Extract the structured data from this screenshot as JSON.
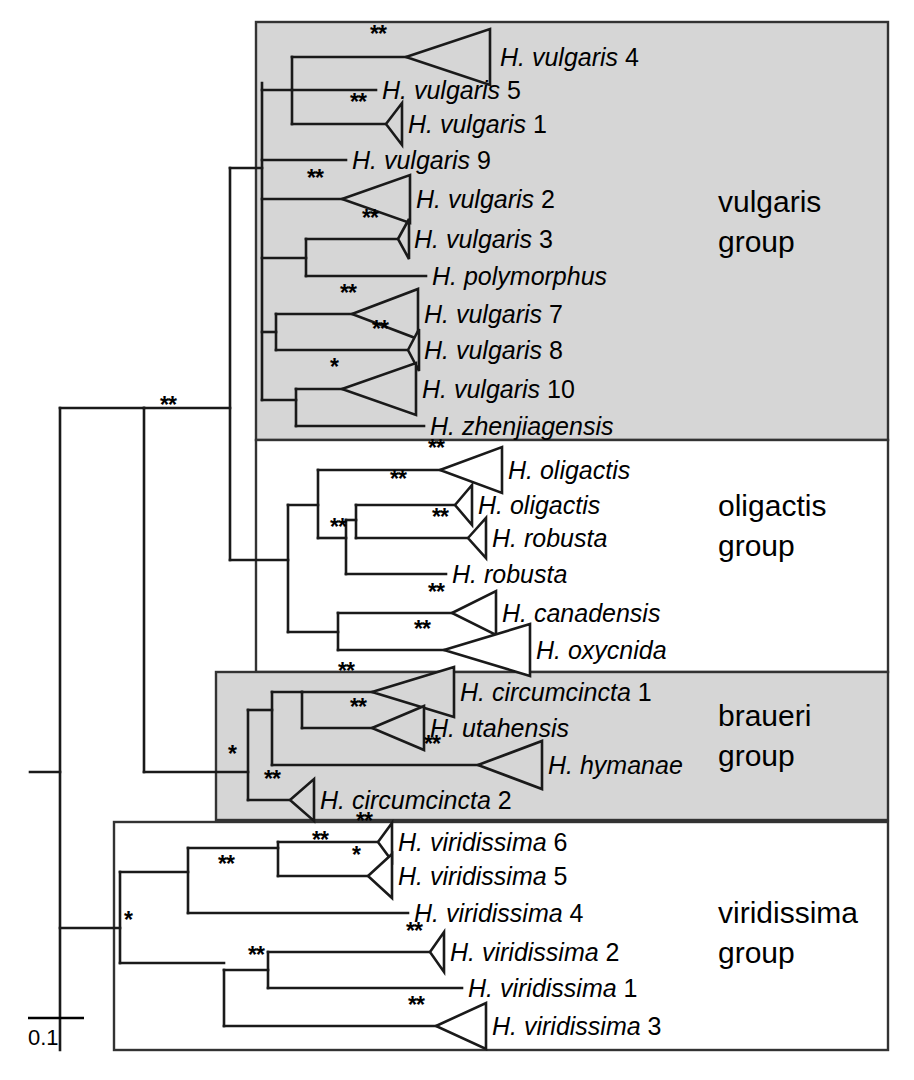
{
  "figure": {
    "scale_bar": {
      "label": "0.1",
      "length_px": 56
    },
    "support_symbols": {
      "strong": "**",
      "weak": "*"
    },
    "colors": {
      "shaded_band": "#d6d6d6",
      "line": "#1a1a1a",
      "background": "#ffffff"
    }
  },
  "groups": [
    {
      "id": "vulgaris",
      "label_line1": "vulgaris",
      "label_line2": "group",
      "shaded": true,
      "box": {
        "x": 256,
        "y": 22,
        "w": 632,
        "h": 418
      }
    },
    {
      "id": "oligactis",
      "label_line1": "oligactis",
      "label_line2": "group",
      "shaded": false,
      "box": {
        "x": 256,
        "y": 440,
        "w": 632,
        "h": 232
      }
    },
    {
      "id": "braueri",
      "label_line1": "braueri",
      "label_line2": "group",
      "shaded": true,
      "box": {
        "x": 216,
        "y": 672,
        "w": 672,
        "h": 148
      }
    },
    {
      "id": "viridissima",
      "label_line1": "viridissima",
      "label_line2": "group",
      "shaded": false,
      "box": {
        "x": 114,
        "y": 822,
        "w": 774,
        "h": 228
      }
    }
  ],
  "group_label_positions": [
    {
      "group": "vulgaris",
      "x": 718,
      "y1": 212,
      "y2": 252
    },
    {
      "group": "oligactis",
      "x": 718,
      "y1": 516,
      "y2": 556
    },
    {
      "group": "braueri",
      "x": 718,
      "y1": 726,
      "y2": 766
    },
    {
      "group": "viridissima",
      "x": 718,
      "y1": 923,
      "y2": 963
    }
  ],
  "taxa": [
    {
      "id": "vulgaris4",
      "genus": "H. ",
      "species": "vulgaris",
      "suffix": " 4",
      "label_x": 500,
      "y": 57,
      "tip": "triangle",
      "tri_apex_x": 406,
      "tri_right_x": 490,
      "tri_half_h": 28,
      "support": "**",
      "sup_x": 370,
      "sup_y": 42,
      "shaded": true
    },
    {
      "id": "vulgaris5",
      "genus": "H. ",
      "species": "vulgaris",
      "suffix": " 5",
      "label_x": 382,
      "y": 90,
      "tip": "line",
      "tip_end_x": 376,
      "support": null,
      "shaded": true
    },
    {
      "id": "vulgaris1",
      "genus": "H. ",
      "species": "vulgaris",
      "suffix": " 1",
      "label_x": 408,
      "y": 124,
      "tip": "triangle",
      "tri_apex_x": 386,
      "tri_right_x": 402,
      "tri_half_h": 21,
      "support": "**",
      "sup_x": 350,
      "sup_y": 110,
      "shaded": true
    },
    {
      "id": "vulgaris9",
      "genus": "H. ",
      "species": "vulgaris",
      "suffix": " 9",
      "label_x": 352,
      "y": 160,
      "tip": "line",
      "tip_end_x": 346,
      "support": null,
      "shaded": true
    },
    {
      "id": "vulgaris2",
      "genus": "H. ",
      "species": "vulgaris",
      "suffix": " 2",
      "label_x": 416,
      "y": 199,
      "tip": "triangle",
      "tri_apex_x": 342,
      "tri_right_x": 410,
      "tri_half_h": 24,
      "support": "**",
      "sup_x": 307,
      "sup_y": 186,
      "shaded": true
    },
    {
      "id": "vulgaris3",
      "genus": "H. ",
      "species": "vulgaris",
      "suffix": " 3",
      "label_x": 414,
      "y": 239,
      "tip": "triangle",
      "tri_apex_x": 398,
      "tri_right_x": 409,
      "tri_half_h": 20,
      "support": "**",
      "sup_x": 362,
      "sup_y": 226,
      "shaded": true
    },
    {
      "id": "polymorphus",
      "genus": "H. ",
      "species": "polymorphus",
      "suffix": "",
      "label_x": 432,
      "y": 276,
      "tip": "line",
      "tip_end_x": 426,
      "support": null,
      "shaded": true
    },
    {
      "id": "vulgaris7",
      "genus": "H. ",
      "species": "vulgaris",
      "suffix": " 7",
      "label_x": 424,
      "y": 314,
      "tip": "triangle",
      "tri_apex_x": 352,
      "tri_right_x": 418,
      "tri_half_h": 25,
      "support": "**",
      "sup_x": 340,
      "sup_y": 301,
      "shaded": true
    },
    {
      "id": "vulgaris8",
      "genus": "H. ",
      "species": "vulgaris",
      "suffix": " 8",
      "label_x": 424,
      "y": 350,
      "tip": "triangle",
      "tri_apex_x": 408,
      "tri_right_x": 419,
      "tri_half_h": 21,
      "support": "**",
      "sup_x": 372,
      "sup_y": 337,
      "shaded": true
    },
    {
      "id": "vulgaris10",
      "genus": "H. ",
      "species": "vulgaris",
      "suffix": " 10",
      "label_x": 422,
      "y": 389,
      "tip": "triangle",
      "tri_apex_x": 342,
      "tri_right_x": 416,
      "tri_half_h": 26,
      "support": "*",
      "sup_x": 330,
      "sup_y": 375,
      "shaded": true
    },
    {
      "id": "zhenjiagensis",
      "genus": "H. ",
      "species": "zhenjiagensis",
      "suffix": "",
      "label_x": 430,
      "y": 426,
      "tip": "line",
      "tip_end_x": 424,
      "support": null,
      "shaded": true
    },
    {
      "id": "oligactisA",
      "genus": "H. ",
      "species": "oligactis",
      "suffix": "",
      "label_x": 508,
      "y": 470,
      "tip": "triangle",
      "tri_apex_x": 440,
      "tri_right_x": 502,
      "tri_half_h": 23,
      "support": "**",
      "sup_x": 428,
      "sup_y": 456,
      "shaded": false
    },
    {
      "id": "oligactisB",
      "genus": "H. ",
      "species": "oligactis",
      "suffix": "",
      "label_x": 478,
      "y": 505,
      "tip": "triangle",
      "tri_apex_x": 455,
      "tri_right_x": 472,
      "tri_half_h": 20,
      "support": null,
      "sup_x": null,
      "sup_y": null,
      "shaded": false
    },
    {
      "id": "robustaA",
      "genus": "H. ",
      "species": "robusta",
      "suffix": "",
      "label_x": 492,
      "y": 538,
      "tip": "triangle",
      "tri_apex_x": 468,
      "tri_right_x": 486,
      "tri_half_h": 20,
      "support": "**",
      "sup_x": 432,
      "sup_y": 525,
      "shaded": false
    },
    {
      "id": "robustaB",
      "genus": "H. ",
      "species": "robusta",
      "suffix": "",
      "label_x": 452,
      "y": 574,
      "tip": "line",
      "tip_end_x": 446,
      "support": null,
      "shaded": false
    },
    {
      "id": "canadensis",
      "genus": "H. ",
      "species": "canadensis",
      "suffix": "",
      "label_x": 502,
      "y": 613,
      "tip": "triangle",
      "tri_apex_x": 452,
      "tri_right_x": 496,
      "tri_half_h": 22,
      "support": "**",
      "sup_x": 428,
      "sup_y": 600,
      "shaded": false
    },
    {
      "id": "oxycnida",
      "genus": "H. ",
      "species": "oxycnida",
      "suffix": "",
      "label_x": 536,
      "y": 650,
      "tip": "triangle",
      "tri_apex_x": 444,
      "tri_right_x": 530,
      "tri_half_h": 26,
      "support": "**",
      "sup_x": 414,
      "sup_y": 637,
      "shaded": false
    },
    {
      "id": "circumcincta1",
      "genus": "H. ",
      "species": "circumcincta",
      "suffix": " 1",
      "label_x": 460,
      "y": 692,
      "tip": "triangle",
      "tri_apex_x": 372,
      "tri_right_x": 454,
      "tri_half_h": 25,
      "support": "**",
      "sup_x": 338,
      "sup_y": 679,
      "shaded": true
    },
    {
      "id": "utahensis",
      "genus": "H. ",
      "species": "utahensis",
      "suffix": "",
      "label_x": 430,
      "y": 728,
      "tip": "triangle",
      "tri_apex_x": 372,
      "tri_right_x": 424,
      "tri_half_h": 22,
      "support": "**",
      "sup_x": 350,
      "sup_y": 715,
      "shaded": true
    },
    {
      "id": "hymanae",
      "genus": "H. ",
      "species": "hymanae",
      "suffix": "",
      "label_x": 548,
      "y": 765,
      "tip": "triangle",
      "tri_apex_x": 478,
      "tri_right_x": 542,
      "tri_half_h": 24,
      "support": "**",
      "sup_x": 424,
      "sup_y": 752,
      "shaded": true
    },
    {
      "id": "circumcincta2",
      "genus": "H. ",
      "species": "circumcincta",
      "suffix": " 2",
      "label_x": 320,
      "y": 800,
      "tip": "triangle",
      "tri_apex_x": 290,
      "tri_right_x": 314,
      "tri_half_h": 21,
      "support": "**",
      "sup_x": 264,
      "sup_y": 787,
      "shaded": true
    },
    {
      "id": "viridissima6",
      "genus": "H. ",
      "species": "viridissima",
      "suffix": " 6",
      "label_x": 398,
      "y": 842,
      "tip": "triangle",
      "tri_apex_x": 378,
      "tri_right_x": 392,
      "tri_half_h": 19,
      "support": "**",
      "sup_x": 356,
      "sup_y": 829,
      "shaded": false
    },
    {
      "id": "viridissima5",
      "genus": "H. ",
      "species": "viridissima",
      "suffix": " 5",
      "label_x": 398,
      "y": 876,
      "tip": "triangle",
      "tri_apex_x": 368,
      "tri_right_x": 392,
      "tri_half_h": 22,
      "support": "*",
      "sup_x": 352,
      "sup_y": 863,
      "shaded": false
    },
    {
      "id": "viridissima4",
      "genus": "H. ",
      "species": "viridissima",
      "suffix": " 4",
      "label_x": 414,
      "y": 913,
      "tip": "line",
      "tip_end_x": 408,
      "support": null,
      "shaded": false
    },
    {
      "id": "viridissima2",
      "genus": "H. ",
      "species": "viridissima",
      "suffix": " 2",
      "label_x": 450,
      "y": 952,
      "tip": "triangle",
      "tri_apex_x": 430,
      "tri_right_x": 444,
      "tri_half_h": 20,
      "support": "**",
      "sup_x": 406,
      "sup_y": 939,
      "shaded": false
    },
    {
      "id": "viridissima1",
      "genus": "H. ",
      "species": "viridissima",
      "suffix": " 1",
      "label_x": 468,
      "y": 988,
      "tip": "line",
      "tip_end_x": 462,
      "support": null,
      "shaded": false
    },
    {
      "id": "viridissima3",
      "genus": "H. ",
      "species": "viridissima",
      "suffix": " 3",
      "label_x": 492,
      "y": 1026,
      "tip": "triangle",
      "tri_apex_x": 436,
      "tri_right_x": 486,
      "tri_half_h": 23,
      "support": "**",
      "sup_x": 408,
      "sup_y": 1013,
      "shaded": false
    }
  ],
  "internal_supports": [
    {
      "id": "backbone-vulgaris-oligactis",
      "value": "**",
      "x": 160,
      "y": 413
    },
    {
      "id": "oligactis-crown",
      "value": "**",
      "x": 390,
      "y": 487
    },
    {
      "id": "oligactis-stem",
      "value": "**",
      "x": 330,
      "y": 535
    },
    {
      "id": "braueri-stem",
      "value": "*",
      "x": 228,
      "y": 762
    },
    {
      "id": "viridissima-stem",
      "value": "*",
      "x": 124,
      "y": 928
    },
    {
      "id": "viridissima-upper",
      "value": "**",
      "x": 218,
      "y": 872
    },
    {
      "id": "viridissima-upper2",
      "value": "**",
      "x": 312,
      "y": 848
    },
    {
      "id": "viridissima-lower",
      "value": "**",
      "x": 248,
      "y": 963
    }
  ]
}
